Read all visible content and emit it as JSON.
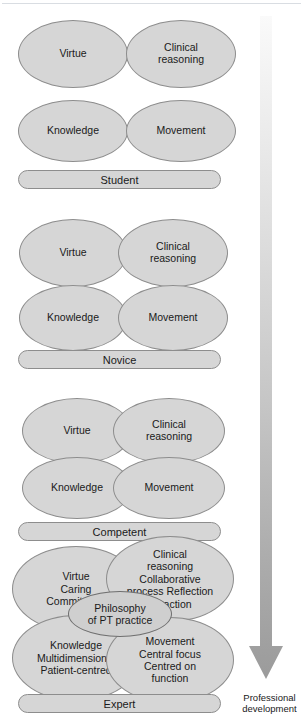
{
  "figure": {
    "background_color": "#ffffff",
    "ellipse_fill": "#d6d6d6",
    "ellipse_stroke": "#8d8d8d",
    "core_fill": "#cfcfcf",
    "arrow_color_start": "#f4f4f4",
    "arrow_color_end": "#9a9a9a"
  },
  "stages": [
    {
      "id": "student",
      "label": "Student",
      "attributes": [
        {
          "key": "virtue",
          "text": "Virtue"
        },
        {
          "key": "clinical-reasoning",
          "text": "Clinical\nreasoning"
        },
        {
          "key": "knowledge",
          "text": "Knowledge"
        },
        {
          "key": "movement",
          "text": "Movement"
        }
      ]
    },
    {
      "id": "novice",
      "label": "Novice",
      "attributes": [
        {
          "key": "virtue",
          "text": "Virtue"
        },
        {
          "key": "clinical-reasoning",
          "text": "Clinical\nreasoning"
        },
        {
          "key": "knowledge",
          "text": "Knowledge"
        },
        {
          "key": "movement",
          "text": "Movement"
        }
      ]
    },
    {
      "id": "competent",
      "label": "Competent",
      "attributes": [
        {
          "key": "virtue",
          "text": "Virtue"
        },
        {
          "key": "clinical-reasoning",
          "text": "Clinical\nreasoning"
        },
        {
          "key": "knowledge",
          "text": "Knowledge"
        },
        {
          "key": "movement",
          "text": "Movement"
        }
      ]
    },
    {
      "id": "expert",
      "label": "Expert",
      "attributes": [
        {
          "key": "virtue",
          "text": "Virtue\nCaring\nCommitment"
        },
        {
          "key": "clinical-reasoning",
          "text": "Clinical\nreasoning\nCollaborative\nprocess Reflection\n-in-action"
        },
        {
          "key": "knowledge",
          "text": "Knowledge\nMultidimensional\nPatient-centred"
        },
        {
          "key": "movement",
          "text": "Movement\nCentral focus\nCentred on\nfunction"
        }
      ],
      "core": {
        "key": "philosophy",
        "text": "Philosophy\nof PT practice"
      }
    }
  ],
  "arrow": {
    "name": "professional-development-arrow",
    "direction": "down",
    "label": "Professional\ndevelopment"
  }
}
